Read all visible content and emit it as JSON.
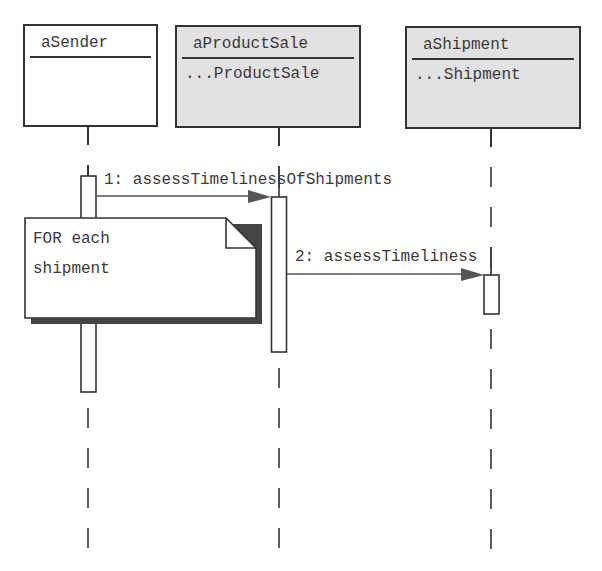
{
  "diagram": {
    "type": "sequence",
    "objects": [
      {
        "name": "aSender",
        "class_label": "",
        "shaded": false
      },
      {
        "name": "aProductSale",
        "class_label": "...ProductSale",
        "shaded": true
      },
      {
        "name": "aShipment",
        "class_label": "...Shipment",
        "shaded": true
      }
    ],
    "messages": [
      {
        "label": "1: assessTimelinessOfShipments",
        "from": "aSender",
        "to": "aProductSale"
      },
      {
        "label": "2: assessTimeliness",
        "from": "aProductSale",
        "to": "aShipment"
      }
    ],
    "note": {
      "line1": "FOR each",
      "line2": "shipment"
    },
    "colors": {
      "stroke": "#333333",
      "object_fill_shaded": "#e2e2e2",
      "object_fill_plain": "#ffffff",
      "arrowhead": "#555555",
      "note_shadow": "#444444"
    }
  }
}
